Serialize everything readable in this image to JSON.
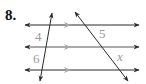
{
  "problem": {
    "number": "8."
  },
  "diagram": {
    "parallel_lines": 3,
    "transversals": 2,
    "segment_labels": {
      "left_top": "4",
      "left_bottom": "6",
      "right_top": "5",
      "right_bottom": "x"
    },
    "colors": {
      "line": "#2a2a2a",
      "parallel_marker": "#a8a8a8",
      "label": "#9a9a9a"
    }
  }
}
